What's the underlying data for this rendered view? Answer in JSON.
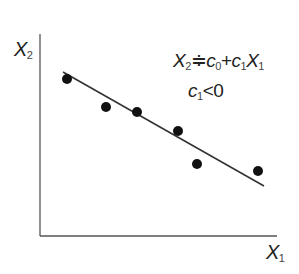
{
  "chart_data": {
    "type": "scatter",
    "title": "",
    "xlabel": "X1",
    "ylabel": "X2",
    "annotations": [
      "X2 ≑ c0 + c1 X1",
      "c1 < 0"
    ],
    "grid": false,
    "legend": null,
    "points_px": [
      {
        "x": 67,
        "y": 79
      },
      {
        "x": 106,
        "y": 107
      },
      {
        "x": 137,
        "y": 112
      },
      {
        "x": 178,
        "y": 131
      },
      {
        "x": 197,
        "y": 164
      },
      {
        "x": 258,
        "y": 171
      }
    ],
    "trend_line_px": {
      "x1": 63,
      "y1": 72,
      "x2": 264,
      "y2": 186
    },
    "axes_px": {
      "origin_x": 40,
      "origin_y": 236,
      "x_end": 277,
      "y_top": 34
    },
    "slope_sign": "negative"
  },
  "labels": {
    "y_axis": {
      "base": "X",
      "sub": "2"
    },
    "x_axis": {
      "base": "X",
      "sub": "1"
    },
    "equation": {
      "lhs_base": "X",
      "lhs_sub": "2",
      "approx": "≑",
      "c0_base": "c",
      "c0_sub": "0",
      "plus": "+",
      "c1_base": "c",
      "c1_sub": "1",
      "x_base": "X",
      "x_sub": "1"
    },
    "condition": {
      "base": "c",
      "sub": "1",
      "rel": "<0"
    }
  },
  "colors": {
    "axis": "#555555",
    "point": "#111111",
    "line": "#333333"
  }
}
